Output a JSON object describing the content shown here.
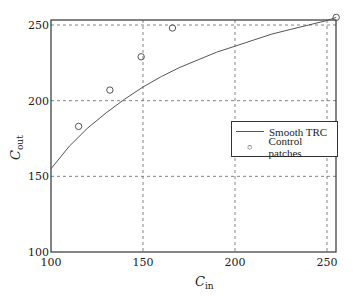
{
  "chart_data": {
    "type": "line",
    "title": "",
    "xlabel": "C_in",
    "ylabel": "C_out",
    "xlim": [
      100,
      256
    ],
    "ylim": [
      100,
      256
    ],
    "xticks": [
      100,
      150,
      200,
      250
    ],
    "yticks": [
      100,
      150,
      200,
      250
    ],
    "grid": true,
    "legend_position": "right-center",
    "series": [
      {
        "name": "Smooth TRC",
        "style": "line",
        "x": [
          100,
          110,
          120,
          130,
          140,
          150,
          160,
          170,
          180,
          190,
          200,
          210,
          220,
          230,
          240,
          250,
          255
        ],
        "y": [
          155,
          170,
          182,
          192,
          201,
          209,
          216,
          222,
          227,
          232,
          236,
          240,
          244,
          247,
          250,
          253,
          255
        ]
      },
      {
        "name": "Control patches",
        "style": "marker-circle",
        "x": [
          115,
          132,
          149,
          166,
          255
        ],
        "y": [
          183,
          207,
          229,
          248,
          255
        ]
      }
    ]
  },
  "axes": {
    "x_label_main": "C",
    "x_label_sub": "in",
    "y_label_main": "C",
    "y_label_sub": "out",
    "x_tick_labels": [
      "100",
      "150",
      "200",
      "250"
    ],
    "y_tick_labels": [
      "100",
      "150",
      "200",
      "250"
    ]
  },
  "legend": {
    "items": [
      "Smooth TRC",
      "Control patches"
    ]
  }
}
